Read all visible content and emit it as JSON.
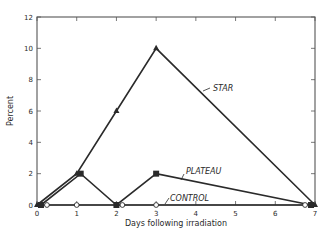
{
  "chart_data": {
    "type": "line",
    "title": "",
    "xlabel": "Days following irradiation",
    "ylabel": "Percent",
    "xlim": [
      0,
      7
    ],
    "ylim": [
      0,
      12
    ],
    "x_ticks": [
      0,
      1,
      2,
      3,
      4,
      5,
      6,
      7
    ],
    "y_ticks": [
      0,
      2,
      4,
      6,
      8,
      10,
      12
    ],
    "grid": false,
    "legend": "inline labels with leader lines",
    "series": [
      {
        "name": "STAR",
        "marker": "filled-triangle",
        "x": [
          0,
          1,
          2,
          3,
          7
        ],
        "y": [
          0,
          2,
          6,
          10,
          0
        ],
        "label_pos": {
          "x": 5.1,
          "y": 7.4
        }
      },
      {
        "name": "PLATEAU",
        "marker": "filled-square",
        "x": [
          0.1,
          1.1,
          2,
          3,
          6.9
        ],
        "y": [
          0,
          2,
          0,
          2,
          0
        ],
        "label_pos": {
          "x": 4.0,
          "y": 2.5
        }
      },
      {
        "name": "CONTROL",
        "marker": "open-circle",
        "x": [
          0.25,
          1,
          2.15,
          3,
          6.75
        ],
        "y": [
          0,
          0,
          0,
          0,
          0
        ],
        "label_pos": {
          "x": 3.6,
          "y": 0.5
        }
      }
    ]
  },
  "colors": {
    "ink": "#2a2a2a",
    "axis": "#555555",
    "background": "#ffffff"
  }
}
